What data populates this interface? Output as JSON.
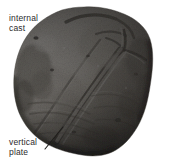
{
  "figure": {
    "type": "photographic-specimen-figure",
    "background_color": "#ffffff",
    "width": 175,
    "height": 167,
    "rendering": "grayscale halftone photograph"
  },
  "annotations": {
    "internal_cast": {
      "line1": "internal",
      "line2": "cast",
      "full_text": "internal cast",
      "color": "#2b2b2b",
      "has_leader_line": false
    },
    "vertical_plate": {
      "line1": "vertical",
      "line2": "plate",
      "full_text": "vertical plate",
      "color": "#2b2b2b",
      "has_leader_line": true
    }
  },
  "specimen": {
    "name": "internal-cast-specimen",
    "description": "rounded ovoid fossil internal cast, grayscale, lit from upper left",
    "tones": {
      "highlight": "#f2f0ed",
      "light": "#d9d6d1",
      "midtone": "#a8a49e",
      "shadow": "#5c5852",
      "deep_shadow": "#2a2724",
      "outline": "#3a3733"
    }
  }
}
